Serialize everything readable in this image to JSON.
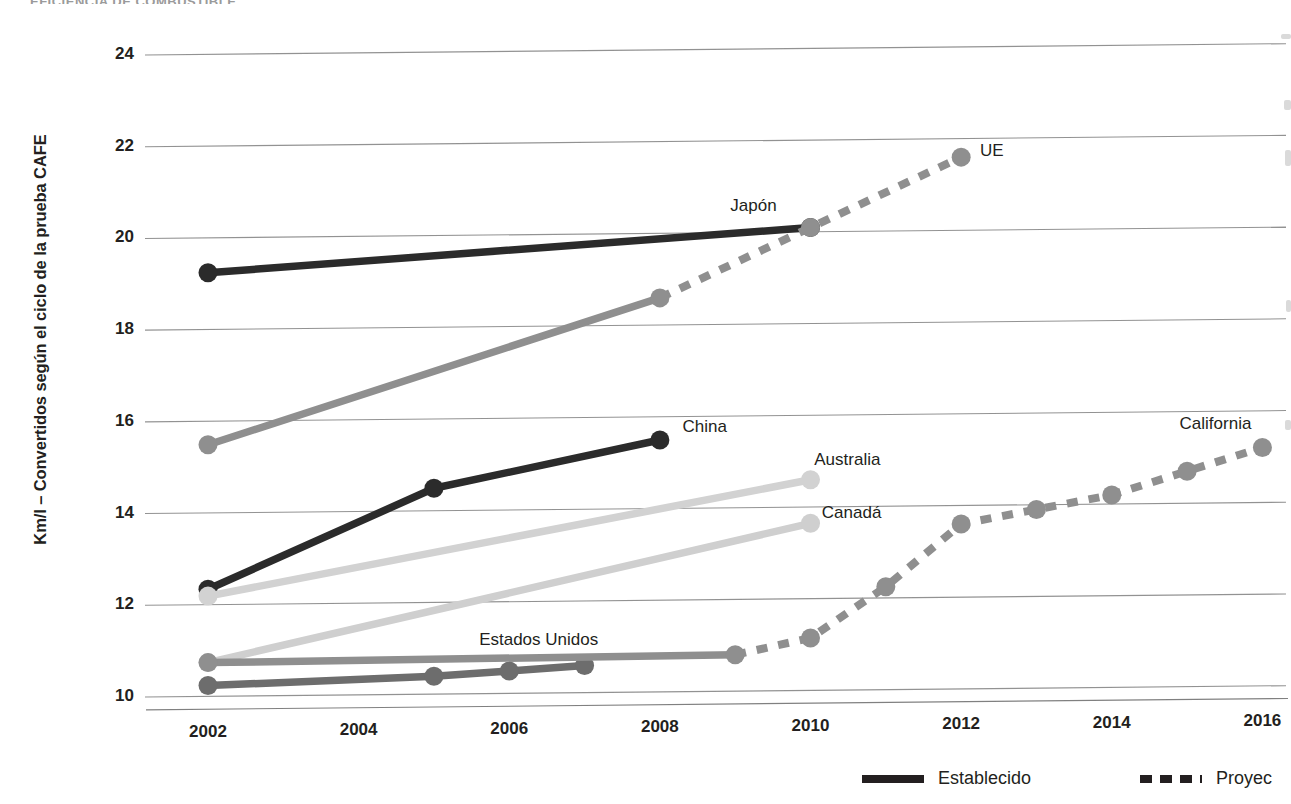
{
  "page": {
    "cut_off_header": "EFICIENCIA DE COMBUSTIBLE"
  },
  "legend": {
    "position": "bottom-right",
    "items": [
      {
        "label": "Establecido",
        "style": "solid"
      },
      {
        "label": "Proyec",
        "style": "dashed"
      }
    ]
  },
  "chart_data": {
    "type": "line",
    "title": "",
    "subtitle": "",
    "xlabel": "",
    "ylabel": "Km/l – Convertidos según el ciclo de la prueba CAFE",
    "xlim": [
      2002,
      2016.3
    ],
    "ylim": [
      9.6,
      24.6
    ],
    "yticks": [
      10,
      12,
      14,
      16,
      18,
      20,
      22,
      24
    ],
    "xticks": [
      2002,
      2004,
      2006,
      2008,
      2010,
      2012,
      2014,
      2016
    ],
    "xtick_labels": [
      "2002",
      "2004",
      "2006",
      "2008",
      "2010",
      "2012",
      "2014",
      "2016"
    ],
    "ytick_labels": [
      "10",
      "12",
      "14",
      "16",
      "18",
      "20",
      "22",
      "24"
    ],
    "grid": "horizontal",
    "grid_color": "#808080",
    "legend_position": "bottom-right",
    "series": [
      {
        "name": "Japón",
        "label": "Japón",
        "color": "#2b2b2b",
        "style": "solid",
        "label_x": 2009.55,
        "label_y": 20.55,
        "label_anchor": "end",
        "x": [
          2002,
          2010
        ],
        "values": [
          19.25,
          20.1
        ]
      },
      {
        "name": "UE",
        "label": "UE",
        "color": "#8f8f8f",
        "style": "mixed",
        "label_x": 2012.25,
        "label_y": 21.7,
        "label_anchor": "start",
        "x": [
          2002,
          2008,
          2010,
          2012
        ],
        "values": [
          15.5,
          18.6,
          20.1,
          21.6
        ],
        "solid_until": 2008
      },
      {
        "name": "China",
        "label": "China",
        "color": "#2b2b2b",
        "style": "solid",
        "label_x": 2008.3,
        "label_y": 15.75,
        "label_anchor": "start",
        "x": [
          2002,
          2005,
          2008
        ],
        "values": [
          12.35,
          14.5,
          15.5
        ]
      },
      {
        "name": "Australia",
        "label": "Australia",
        "color": "#d2d2d2",
        "style": "solid",
        "label_x": 2010.05,
        "label_y": 15.0,
        "label_anchor": "start",
        "x": [
          2002,
          2010
        ],
        "values": [
          12.2,
          14.6
        ]
      },
      {
        "name": "Canadá",
        "label": "Canadá",
        "color": "#cfcfcf",
        "style": "solid",
        "label_x": 2010.15,
        "label_y": 13.85,
        "label_anchor": "start",
        "x": [
          2002,
          2010
        ],
        "values": [
          10.75,
          13.65
        ]
      },
      {
        "name": "Estados Unidos",
        "label": "Estados Unidos",
        "color": "#6d6d6d",
        "style": "solid",
        "label_x": 2005.6,
        "label_y": 11.15,
        "label_anchor": "start",
        "x": [
          2002,
          2005,
          2006,
          2007
        ],
        "values": [
          10.25,
          10.4,
          10.5,
          10.6
        ]
      },
      {
        "name": "California",
        "label": "California",
        "color": "#8f8f8f",
        "style": "mixed",
        "label_x": 2014.9,
        "label_y": 15.7,
        "label_anchor": "start",
        "x": [
          2002,
          2009,
          2010,
          2011,
          2012,
          2013,
          2014,
          2015,
          2016
        ],
        "values": [
          10.75,
          10.8,
          11.15,
          12.25,
          13.6,
          13.9,
          14.2,
          14.7,
          15.2
        ],
        "solid_until": 2009
      }
    ]
  }
}
